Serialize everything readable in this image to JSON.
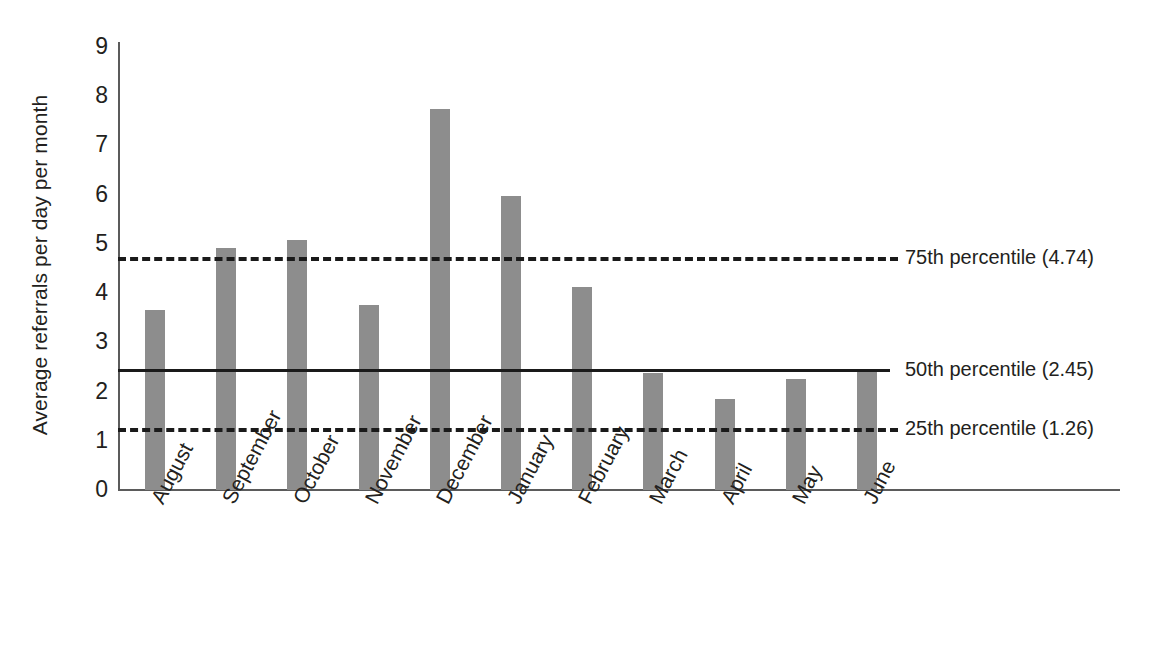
{
  "chart_data": {
    "type": "bar",
    "title": "",
    "xlabel": "",
    "ylabel": "Average referrals per day per month",
    "ylim": [
      0,
      9
    ],
    "yticks": [
      0,
      1,
      2,
      3,
      4,
      5,
      6,
      7,
      8,
      9
    ],
    "grid": false,
    "legend_position": "right-inline-annotations",
    "categories": [
      "August",
      "September",
      "October",
      "November",
      "December",
      "January",
      "February",
      "March",
      "April",
      "May",
      "June"
    ],
    "values": [
      3.66,
      4.92,
      5.08,
      3.75,
      7.74,
      5.98,
      4.12,
      2.38,
      1.85,
      2.25,
      2.4
    ],
    "series": [
      {
        "name": "Average referrals per day per month",
        "values": [
          3.66,
          4.92,
          5.08,
          3.75,
          7.74,
          5.98,
          4.12,
          2.38,
          1.85,
          2.25,
          2.4
        ],
        "color": "#8d8d8d"
      }
    ],
    "reference_lines": [
      {
        "id": "p75",
        "label": "75th percentile (4.74)",
        "value": 4.74,
        "style": "dashed",
        "color": "#1a1a1a"
      },
      {
        "id": "p50",
        "label": "50th percentile (2.45)",
        "value": 2.45,
        "style": "solid",
        "color": "#1a1a1a"
      },
      {
        "id": "p25",
        "label": "25th percentile (1.26)",
        "value": 1.26,
        "style": "dashed",
        "color": "#1a1a1a"
      }
    ]
  }
}
